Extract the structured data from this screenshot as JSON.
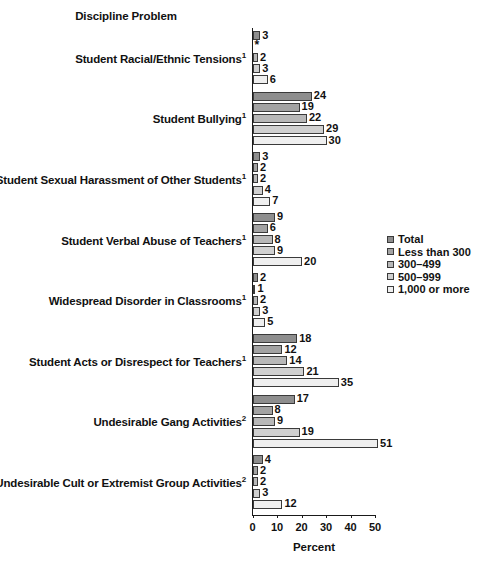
{
  "chart_data": {
    "type": "bar",
    "orientation": "horizontal",
    "title": "Discipline Problem",
    "xlabel": "Percent",
    "ylabel": "",
    "xlim": [
      0,
      50
    ],
    "xticks": [
      0,
      10,
      20,
      30,
      40,
      50
    ],
    "xtick_labels": [
      "0",
      "10",
      "20",
      "30",
      "40",
      "50"
    ],
    "grid": false,
    "legend_position": "right-middle",
    "suppressed_marker": "*",
    "categories": [
      "Student Racial/Ethnic Tensions¹",
      "Student Bullying¹",
      "Student Sexual Harassment of Other Students¹",
      "Student Verbal Abuse of Teachers¹",
      "Widespread Disorder in Classrooms¹",
      "Student Acts or Disrespect for Teachers¹",
      "Undesirable Gang Activities²",
      "Undesirable Cult or Extremist Group Activities²"
    ],
    "series": [
      {
        "name": "Total",
        "color": "#8e8e8e",
        "values": [
          3,
          24,
          3,
          9,
          2,
          18,
          17,
          4
        ]
      },
      {
        "name": "Less than 300",
        "color": "#a3a3a3",
        "values": [
          null,
          19,
          2,
          6,
          1,
          12,
          8,
          2
        ]
      },
      {
        "name": "300–499",
        "color": "#b8b8b8",
        "values": [
          2,
          22,
          2,
          8,
          2,
          14,
          9,
          2
        ]
      },
      {
        "name": "500–999",
        "color": "#d0d0d0",
        "values": [
          3,
          29,
          4,
          9,
          3,
          21,
          19,
          3
        ]
      },
      {
        "name": "1,000 or more",
        "color": "#efefef",
        "values": [
          6,
          30,
          7,
          20,
          5,
          35,
          51,
          12
        ]
      }
    ]
  },
  "groups": [
    {
      "label_lines": [
        {
          "text": "Student Racial/Ethnic Tensions",
          "sup": "1"
        }
      ],
      "bars": [
        {
          "series": "Total",
          "value": 3,
          "label": "3",
          "color": "#8e8e8e"
        },
        {
          "series": "Less than 300",
          "value": null,
          "label": "*",
          "color": null
        },
        {
          "series": "300–499",
          "value": 2,
          "label": "2",
          "color": "#b8b8b8"
        },
        {
          "series": "500–999",
          "value": 3,
          "label": "3",
          "color": "#d0d0d0"
        },
        {
          "series": "1,000 or more",
          "value": 6,
          "label": "6",
          "color": "#efefef"
        }
      ]
    },
    {
      "label_lines": [
        {
          "text": "Student Bullying",
          "sup": "1"
        }
      ],
      "bars": [
        {
          "series": "Total",
          "value": 24,
          "label": "24",
          "color": "#8e8e8e"
        },
        {
          "series": "Less than 300",
          "value": 19,
          "label": "19",
          "color": "#a3a3a3"
        },
        {
          "series": "300–499",
          "value": 22,
          "label": "22",
          "color": "#b8b8b8"
        },
        {
          "series": "500–999",
          "value": 29,
          "label": "29",
          "color": "#d0d0d0"
        },
        {
          "series": "1,000 or more",
          "value": 30,
          "label": "30",
          "color": "#efefef"
        }
      ]
    },
    {
      "label_lines": [
        {
          "text": "Student Sexual Harassment of Other Students",
          "sup": "1"
        }
      ],
      "bars": [
        {
          "series": "Total",
          "value": 3,
          "label": "3",
          "color": "#8e8e8e"
        },
        {
          "series": "Less than 300",
          "value": 2,
          "label": "2",
          "color": "#a3a3a3"
        },
        {
          "series": "300–499",
          "value": 2,
          "label": "2",
          "color": "#b8b8b8"
        },
        {
          "series": "500–999",
          "value": 4,
          "label": "4",
          "color": "#d0d0d0"
        },
        {
          "series": "1,000 or more",
          "value": 7,
          "label": "7",
          "color": "#efefef"
        }
      ]
    },
    {
      "label_lines": [
        {
          "text": "Student Verbal Abuse of Teachers",
          "sup": "1"
        }
      ],
      "bars": [
        {
          "series": "Total",
          "value": 9,
          "label": "9",
          "color": "#8e8e8e"
        },
        {
          "series": "Less than 300",
          "value": 6,
          "label": "6",
          "color": "#a3a3a3"
        },
        {
          "series": "300–499",
          "value": 8,
          "label": "8",
          "color": "#b8b8b8"
        },
        {
          "series": "500–999",
          "value": 9,
          "label": "9",
          "color": "#d0d0d0"
        },
        {
          "series": "1,000 or more",
          "value": 20,
          "label": "20",
          "color": "#efefef"
        }
      ]
    },
    {
      "label_lines": [
        {
          "text": "Widespread Disorder in Classrooms",
          "sup": "1"
        }
      ],
      "bars": [
        {
          "series": "Total",
          "value": 2,
          "label": "2",
          "color": "#8e8e8e"
        },
        {
          "series": "Less than 300",
          "value": 1,
          "label": "1",
          "color": "#a3a3a3"
        },
        {
          "series": "300–499",
          "value": 2,
          "label": "2",
          "color": "#b8b8b8"
        },
        {
          "series": "500–999",
          "value": 3,
          "label": "3",
          "color": "#d0d0d0"
        },
        {
          "series": "1,000 or more",
          "value": 5,
          "label": "5",
          "color": "#efefef"
        }
      ]
    },
    {
      "label_lines": [
        {
          "text": "Student Acts or Disrespect for Teachers",
          "sup": "1"
        }
      ],
      "bars": [
        {
          "series": "Total",
          "value": 18,
          "label": "18",
          "color": "#8e8e8e"
        },
        {
          "series": "Less than 300",
          "value": 12,
          "label": "12",
          "color": "#a3a3a3"
        },
        {
          "series": "300–499",
          "value": 14,
          "label": "14",
          "color": "#b8b8b8"
        },
        {
          "series": "500–999",
          "value": 21,
          "label": "21",
          "color": "#d0d0d0"
        },
        {
          "series": "1,000 or more",
          "value": 35,
          "label": "35",
          "color": "#efefef"
        }
      ]
    },
    {
      "label_lines": [
        {
          "text": "Undesirable Gang Activities",
          "sup": "2"
        }
      ],
      "bars": [
        {
          "series": "Total",
          "value": 17,
          "label": "17",
          "color": "#8e8e8e"
        },
        {
          "series": "Less than 300",
          "value": 8,
          "label": "8",
          "color": "#a3a3a3"
        },
        {
          "series": "300–499",
          "value": 9,
          "label": "9",
          "color": "#b8b8b8"
        },
        {
          "series": "500–999",
          "value": 19,
          "label": "19",
          "color": "#d0d0d0"
        },
        {
          "series": "1,000 or more",
          "value": 51,
          "label": "51",
          "color": "#efefef"
        }
      ]
    },
    {
      "label_lines": [
        {
          "text": "Undesirable Cult or Extremist Group Activities",
          "sup": "2"
        }
      ],
      "bars": [
        {
          "series": "Total",
          "value": 4,
          "label": "4",
          "color": "#8e8e8e"
        },
        {
          "series": "Less than 300",
          "value": 2,
          "label": "2",
          "color": "#a3a3a3"
        },
        {
          "series": "300–499",
          "value": 2,
          "label": "2",
          "color": "#b8b8b8"
        },
        {
          "series": "500–999",
          "value": 3,
          "label": "3",
          "color": "#d0d0d0"
        },
        {
          "series": "1,000 or more",
          "value": 12,
          "label": "12",
          "color": "#efefef"
        }
      ]
    }
  ],
  "legend": {
    "items": [
      {
        "label": "Total",
        "color": "#8e8e8e"
      },
      {
        "label": "Less than 300",
        "color": "#a3a3a3"
      },
      {
        "label": "300–499",
        "color": "#b8b8b8"
      },
      {
        "label": "500–999",
        "color": "#d0d0d0"
      },
      {
        "label": "1,000 or more",
        "color": "#efefef"
      }
    ]
  },
  "axis": {
    "title": "Discipline Problem",
    "x_caption": "Percent",
    "ticks": [
      "0",
      "10",
      "20",
      "30",
      "40",
      "50"
    ]
  }
}
